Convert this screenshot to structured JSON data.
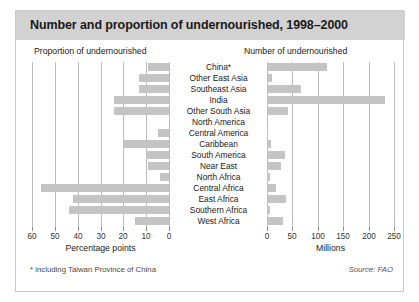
{
  "chart_data": {
    "type": "bar",
    "title": "Number and proportion of undernourished, 1998–2000",
    "subtitle": "",
    "orientation": "horizontal",
    "layout": "back-to-back bidirectional bar chart with centred category labels",
    "grid": true,
    "legend_position": "none",
    "categories": [
      "China*",
      "Other East Asia",
      "Southeast Asia",
      "India",
      "Other South Asia",
      "North America",
      "Central America",
      "Caribbean",
      "South America",
      "Near East",
      "North Africa",
      "Central Africa",
      "East Africa",
      "Southern Africa",
      "West Africa"
    ],
    "panels": [
      {
        "id": "left",
        "heading": "Proportion of undernourished",
        "xlabel": "Percentage points",
        "direction": "right-to-left",
        "xlim": [
          0,
          60
        ],
        "reversed": true,
        "ticks": [
          60,
          50,
          40,
          30,
          20,
          10,
          0
        ],
        "values": [
          9,
          13,
          13,
          24,
          24,
          0,
          5,
          20,
          10,
          9,
          4,
          56,
          42,
          44,
          15
        ]
      },
      {
        "id": "right",
        "heading": "Number of undernourished",
        "xlabel": "Millions",
        "direction": "left-to-right",
        "xlim": [
          0,
          250
        ],
        "reversed": false,
        "ticks": [
          0,
          50,
          100,
          150,
          200,
          250
        ],
        "values": [
          119,
          9,
          66,
          233,
          42,
          0,
          2,
          7,
          35,
          27,
          6,
          17,
          38,
          5,
          32
        ]
      }
    ],
    "series": [
      {
        "name": "Proportion of undernourished (percentage points)",
        "values": [
          9,
          13,
          13,
          24,
          24,
          0,
          5,
          20,
          10,
          9,
          4,
          56,
          42,
          44,
          15
        ]
      },
      {
        "name": "Number of undernourished (millions)",
        "values": [
          119,
          9,
          66,
          233,
          42,
          0,
          2,
          7,
          35,
          27,
          6,
          17,
          38,
          5,
          32
        ]
      }
    ],
    "colors": {
      "bar": "#c4c4c4",
      "title_banner": "#d2d2d2",
      "gridline": "#bcbcbc",
      "text": "#1a1a1a",
      "frame": "#c8c8c8"
    }
  },
  "footer": {
    "footnote": "* including Taiwan Province of China",
    "source": "Source: FAO"
  }
}
